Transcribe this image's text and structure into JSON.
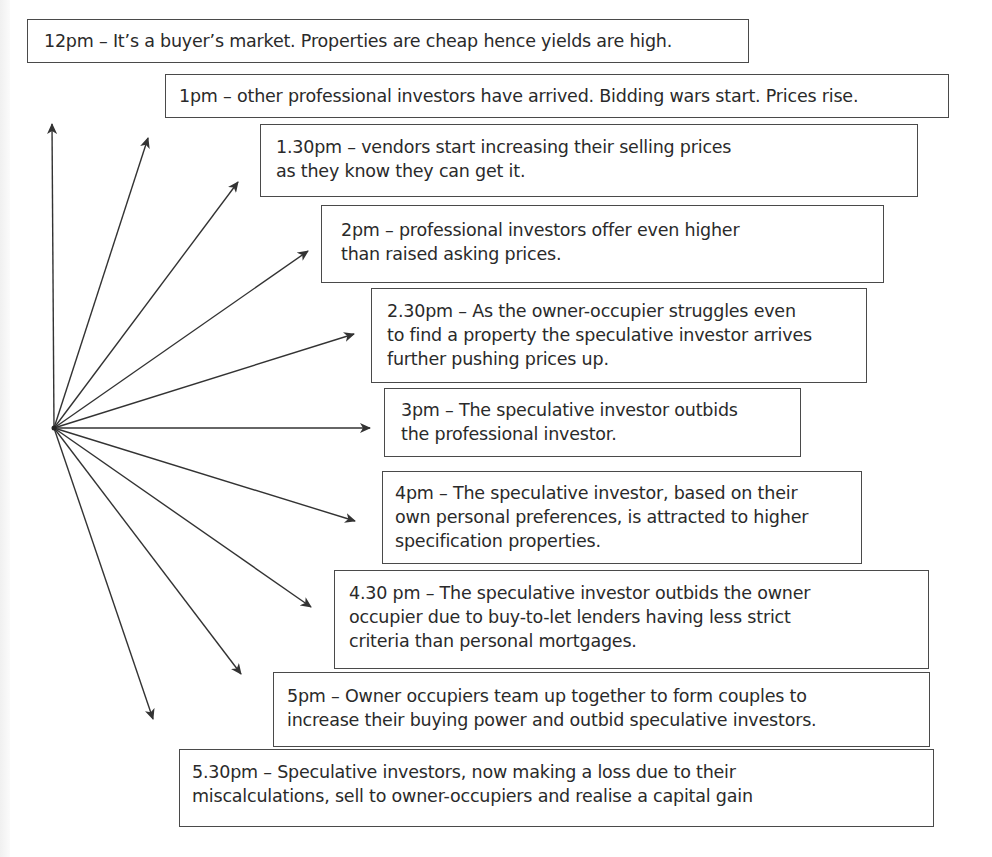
{
  "diagram": {
    "origin": {
      "x": 54,
      "y": 428
    },
    "line_color": "#333333",
    "events": [
      {
        "time": "12pm",
        "text": "12pm – It’s a buyer’s market. Properties are cheap hence yields are high.",
        "box": {
          "x": 27,
          "y": 19,
          "w": 722,
          "h": 44,
          "pad_l": 16,
          "pad_t": 9
        },
        "arrow_tip": {
          "x": 52,
          "y": 124
        }
      },
      {
        "time": "1pm",
        "text": "1pm – other professional investors have arrived.  Bidding wars start.  Prices rise.",
        "box": {
          "x": 165,
          "y": 74,
          "w": 784,
          "h": 44,
          "pad_l": 13,
          "pad_t": 9
        },
        "arrow_tip": {
          "x": 148,
          "y": 138
        }
      },
      {
        "time": "1.30pm",
        "text": "1.30pm – vendors start increasing their selling prices\nas they know they can get it.",
        "box": {
          "x": 260,
          "y": 124,
          "w": 658,
          "h": 73,
          "pad_l": 15,
          "pad_t": 10
        },
        "arrow_tip": {
          "x": 238,
          "y": 182
        }
      },
      {
        "time": "2pm",
        "text": "2pm – professional investors offer even higher\nthan raised asking prices.",
        "box": {
          "x": 321,
          "y": 205,
          "w": 563,
          "h": 78,
          "pad_l": 19,
          "pad_t": 12
        },
        "arrow_tip": {
          "x": 308,
          "y": 251
        }
      },
      {
        "time": "2.30pm",
        "text": "2.30pm – As the owner-occupier struggles even\nto find a property the speculative investor arrives\nfurther pushing prices up.",
        "box": {
          "x": 371,
          "y": 288,
          "w": 496,
          "h": 95,
          "pad_l": 15,
          "pad_t": 10
        },
        "arrow_tip": {
          "x": 354,
          "y": 334
        }
      },
      {
        "time": "3pm",
        "text": "3pm – The speculative investor outbids\nthe professional investor.",
        "box": {
          "x": 384,
          "y": 388,
          "w": 417,
          "h": 69,
          "pad_l": 16,
          "pad_t": 9
        },
        "arrow_tip": {
          "x": 370,
          "y": 428
        }
      },
      {
        "time": "4pm",
        "text": "4pm – The speculative investor, based on their\nown personal preferences, is attracted to higher\nspecification properties.",
        "box": {
          "x": 382,
          "y": 471,
          "w": 480,
          "h": 93,
          "pad_l": 12,
          "pad_t": 9
        },
        "arrow_tip": {
          "x": 355,
          "y": 521
        }
      },
      {
        "time": "4.30pm",
        "text": "4.30 pm – The speculative investor outbids the owner\noccupier due to buy-to-let lenders having less strict\ncriteria than personal mortgages.",
        "box": {
          "x": 334,
          "y": 570,
          "w": 595,
          "h": 99,
          "pad_l": 14,
          "pad_t": 10
        },
        "arrow_tip": {
          "x": 311,
          "y": 607
        }
      },
      {
        "time": "5pm",
        "text": "5pm – Owner occupiers team up together to form couples to\nincrease their buying power and outbid speculative investors.",
        "box": {
          "x": 273,
          "y": 672,
          "w": 657,
          "h": 75,
          "pad_l": 13,
          "pad_t": 11
        },
        "arrow_tip": {
          "x": 241,
          "y": 674
        }
      },
      {
        "time": "5.30pm",
        "text": "5.30pm – Speculative investors, now making a loss due to their\nmiscalculations, sell to owner-occupiers and realise a capital gain",
        "box": {
          "x": 179,
          "y": 749,
          "w": 755,
          "h": 78,
          "pad_l": 12,
          "pad_t": 10
        },
        "arrow_tip": {
          "x": 153,
          "y": 719
        }
      }
    ]
  }
}
